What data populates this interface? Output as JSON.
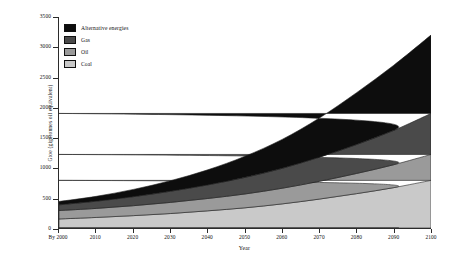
{
  "chart_data": {
    "type": "area",
    "stacked": true,
    "title": "",
    "subtitle": "",
    "xlabel": "Year",
    "ylabel": "Gtoe (gigatonnes oil equivalent)",
    "x": [
      2000,
      2010,
      2020,
      2030,
      2040,
      2050,
      2060,
      2070,
      2080,
      2090,
      2100
    ],
    "xtick_labels": [
      "By 2000",
      "2010",
      "2020",
      "2030",
      "2040",
      "2050",
      "2060",
      "2070",
      "2080",
      "2090",
      "2100"
    ],
    "xlim": [
      2000,
      2100
    ],
    "ylim": [
      0,
      3500
    ],
    "ytick_values": [
      0,
      500,
      1000,
      1500,
      2000,
      2500,
      3000,
      3500
    ],
    "ytick_labels": [
      "0",
      "500",
      "1000",
      "1500",
      "2000",
      "2500",
      "3000",
      "3500"
    ],
    "grid": false,
    "legend_position": "top-left",
    "series": [
      {
        "name": "Coal",
        "color": "#c9c9c9",
        "values": [
          150,
          175,
          205,
          240,
          285,
          335,
          400,
          480,
          570,
          670,
          790
        ]
      },
      {
        "name": "Oil",
        "color": "#9a9a9a",
        "values": [
          140,
          150,
          165,
          185,
          205,
          230,
          260,
          295,
          335,
          380,
          430
        ]
      },
      {
        "name": "Gas",
        "color": "#4a4a4a",
        "values": [
          95,
          120,
          150,
          185,
          225,
          275,
          330,
          400,
          480,
          570,
          680
        ]
      },
      {
        "name": "Alternative energies",
        "color": "#0d0d0d",
        "values": [
          55,
          80,
          120,
          175,
          250,
          350,
          480,
          650,
          860,
          1080,
          1300
        ]
      }
    ],
    "totals": [
      440,
      525,
      640,
      785,
      965,
      1190,
      1470,
      1825,
      2245,
      2700,
      3200
    ]
  },
  "legend": {
    "items": [
      {
        "label": "Alternative energies"
      },
      {
        "label": "Gas"
      },
      {
        "label": "Oil"
      },
      {
        "label": "Coal"
      }
    ]
  }
}
